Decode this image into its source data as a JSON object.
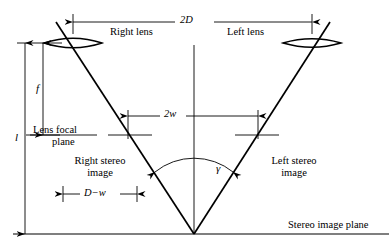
{
  "figure": {
    "background_color": "#ffffff",
    "line_color": "#000000",
    "width": 391,
    "height": 250
  },
  "labels": {
    "right_lens": "Right lens",
    "left_lens": "Left lens",
    "lens_focal_plane_line1": "Lens focal",
    "lens_focal_plane_line2": "plane",
    "right_stereo_line1": "Right stereo",
    "right_stereo_line2": "image",
    "left_stereo_line1": "Left stereo",
    "left_stereo_line2": "image",
    "stereo_image_plane": "Stereo image plane"
  },
  "dimensions": {
    "baseline_2D": "2D",
    "half_separation_2w": "2w",
    "focal_length_f": "f",
    "total_length_l": "l",
    "offset_D_minus_w": "D−w",
    "convergence_angle": "γ"
  },
  "geometry": {
    "right_lens_center_x": 73,
    "left_lens_center_x": 312,
    "lens_center_y": 43,
    "focal_plane_y": 135,
    "image_plane_y": 234,
    "apex_x": 194,
    "apex_y": 234,
    "axis_top_y": 45,
    "dim_2D_y": 22,
    "dim_2w_y": 116,
    "dim_Dw_y": 194,
    "arc_radius": 60
  }
}
